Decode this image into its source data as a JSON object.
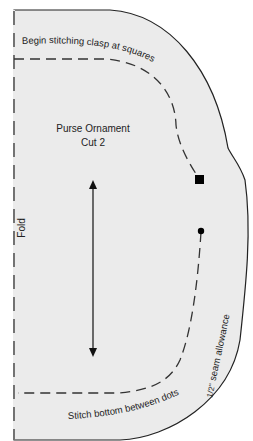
{
  "pattern": {
    "title": "Purse Ornament",
    "subtitle": "Cut 2",
    "fold_label": "Fold",
    "top_instruction": "Begin stitching clasp at squares",
    "bottom_instruction": "Stitch bottom between dots",
    "seam_fraction": "1/2\"",
    "seam_label": "seam allowance",
    "colors": {
      "paper": "#ebebeb",
      "outline": "#222222",
      "background": "#ffffff"
    },
    "markers": [
      {
        "type": "square",
        "meaning": "clasp start"
      },
      {
        "type": "dot",
        "meaning": "bottom stitch start"
      }
    ],
    "grainline": "double-headed arrow (vertical)"
  }
}
